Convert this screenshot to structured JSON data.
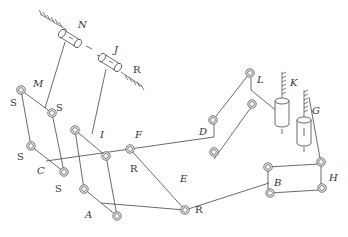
{
  "diagram": {
    "title": "",
    "labels": {
      "N": "N",
      "J": "J",
      "R_top": "R",
      "M": "M",
      "S1": "S",
      "S2": "S",
      "S3": "S",
      "S4": "S",
      "C": "C",
      "I": "I",
      "F": "F",
      "R_mid": "R",
      "A": "A",
      "E": "E",
      "R_bottom": "R",
      "D": "D",
      "L": "L",
      "K": "K",
      "G": "G",
      "B": "B",
      "H": "H"
    },
    "joint_types": {
      "S": "spherical joint",
      "R": "revolute joint"
    },
    "components": [
      {
        "id": "N",
        "type": "prismatic-cylinder",
        "grounded": true
      },
      {
        "id": "J",
        "type": "prismatic-cylinder",
        "grounded": true
      },
      {
        "id": "K",
        "type": "prismatic-cylinder",
        "grounded": true
      },
      {
        "id": "G",
        "type": "prismatic-cylinder",
        "grounded": true
      },
      {
        "id": "M",
        "type": "joint"
      },
      {
        "id": "C",
        "type": "joint"
      },
      {
        "id": "I",
        "type": "joint"
      },
      {
        "id": "F",
        "type": "joint"
      },
      {
        "id": "A",
        "type": "joint"
      },
      {
        "id": "E",
        "type": "joint"
      },
      {
        "id": "D",
        "type": "joint"
      },
      {
        "id": "L",
        "type": "joint"
      },
      {
        "id": "B",
        "type": "joint"
      },
      {
        "id": "H",
        "type": "joint"
      }
    ]
  }
}
